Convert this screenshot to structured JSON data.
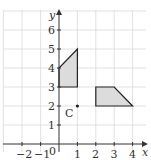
{
  "diagram": {
    "type": "coordinate-grid",
    "axes": {
      "x_label": "x",
      "y_label": "y",
      "origin_label": "0",
      "x_ticks": [
        "−2",
        "−1",
        "1",
        "2",
        "3",
        "4"
      ],
      "y_ticks": [
        "1",
        "2",
        "3",
        "4",
        "5",
        "6"
      ]
    },
    "shapes": [
      {
        "name": "shape-a",
        "vertices": [
          [
            0,
            3
          ],
          [
            1,
            3
          ],
          [
            1,
            5
          ],
          [
            0,
            4
          ]
        ],
        "fill": "#dcdcdc",
        "stroke": "#222222"
      },
      {
        "name": "shape-b",
        "vertices": [
          [
            2,
            2
          ],
          [
            4,
            2
          ],
          [
            3,
            3
          ],
          [
            2,
            3
          ]
        ],
        "fill": "#dcdcdc",
        "stroke": "#222222"
      }
    ],
    "points": [
      {
        "label": "C",
        "coords": [
          1,
          2
        ]
      }
    ],
    "colors": {
      "grid": "#d9d9d9",
      "axis": "#333333",
      "shape_fill": "#dcdcdc",
      "shape_stroke": "#222222"
    }
  }
}
